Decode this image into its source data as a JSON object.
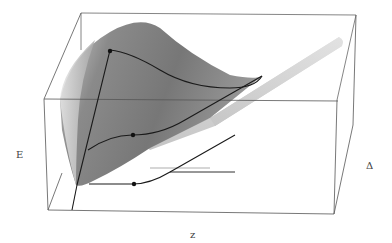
{
  "figure": {
    "type": "3d-surface-plot",
    "axes": {
      "vertical_label": "E",
      "depth_label": "Δ",
      "horizontal_label": "z"
    },
    "colors": {
      "box_line": "#555555",
      "curve": "#1a1a1a",
      "surface_dark": "#6e6e6e",
      "surface_light": "#d8d8d8",
      "tube": "#cfcfcf"
    },
    "curves": [
      {
        "name": "upper-curve",
        "has_marker": true
      },
      {
        "name": "middle-curve",
        "has_marker": true
      },
      {
        "name": "floor-projection-curve",
        "has_marker": true
      }
    ]
  }
}
